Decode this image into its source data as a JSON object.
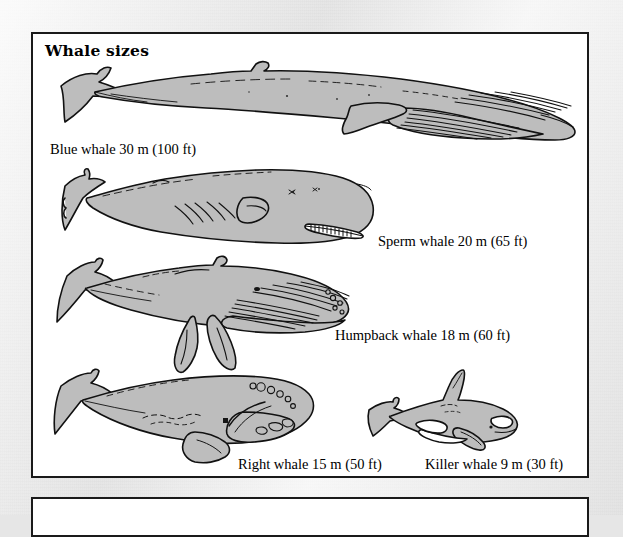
{
  "page": {
    "background_color": "#e6e6e6",
    "paper_style": "scanned-book-page"
  },
  "figure": {
    "title": "Whale sizes",
    "panel_background": "#ffffff",
    "panel_border_color": "#1a1a1a",
    "whale_fill_color": "#bdbdbd",
    "whale_outline_color": "#111111",
    "whales": [
      {
        "name": "blue-whale",
        "label": "Blue whale 30 m (100 ft)",
        "length_m": 30,
        "length_ft": 100
      },
      {
        "name": "sperm-whale",
        "label": "Sperm whale 20 m (65 ft)",
        "length_m": 20,
        "length_ft": 65
      },
      {
        "name": "humpback-whale",
        "label": "Humpback whale 18 m (60 ft)",
        "length_m": 18,
        "length_ft": 60
      },
      {
        "name": "right-whale",
        "label": "Right whale 15 m (50 ft)",
        "length_m": 15,
        "length_ft": 50
      },
      {
        "name": "killer-whale",
        "label": "Killer whale 9 m (30 ft)",
        "length_m": 9,
        "length_ft": 30
      }
    ]
  },
  "next_panel": {
    "content": ""
  }
}
